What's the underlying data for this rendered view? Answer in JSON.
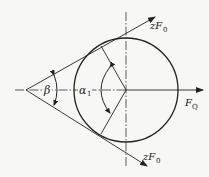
{
  "diagram": {
    "type": "belt-pulley-force-diagram",
    "labels": {
      "upper_force": "zF",
      "upper_force_sub": "0",
      "lower_force": "zF",
      "lower_force_sub": "0",
      "resultant_force": "F",
      "resultant_force_sub": "Q",
      "wedge_angle": "β",
      "wrap_angle": "α",
      "wrap_angle_sub": "1"
    },
    "colors": {
      "stroke": "#222222",
      "background": "#f7f7f5"
    }
  }
}
